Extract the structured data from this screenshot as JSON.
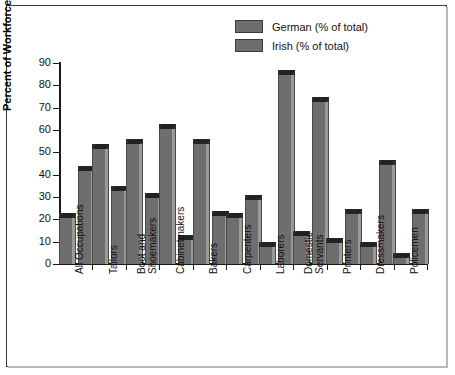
{
  "chart_data": {
    "type": "bar",
    "title": "",
    "xlabel": "",
    "ylabel": "Percent of Workforce",
    "ylim": [
      0,
      90
    ],
    "yticks": [
      0,
      10,
      20,
      30,
      40,
      50,
      60,
      70,
      80,
      90
    ],
    "grid": false,
    "legend_position": "top-right",
    "categories": [
      "All Occupations",
      "Tailors",
      "Boot and Shoemakers",
      "Cabinetmakers",
      "Bakers",
      "Carpenters",
      "Laborers",
      "Domestic Servants",
      "Printers",
      "Dressmakers",
      "Policemen"
    ],
    "category_lines": [
      [
        "All Occupations"
      ],
      [
        "Tailors"
      ],
      [
        "Boot and",
        "Shoemakers"
      ],
      [
        "Cabinetmakers"
      ],
      [
        "Bakers"
      ],
      [
        "Carpenters"
      ],
      [
        "Laborers"
      ],
      [
        "Domestic",
        "Servants"
      ],
      [
        "Printers"
      ],
      [
        "Dressmakers"
      ],
      [
        "Policemen"
      ]
    ],
    "series": [
      {
        "name": "German (% of total)",
        "color": "#6e6e6e",
        "values": [
          21,
          52,
          54,
          61,
          54,
          21,
          8,
          13,
          10,
          8,
          3
        ]
      },
      {
        "name": "Irish (% of total)",
        "color": "#6e6e6e",
        "values": [
          42,
          33,
          30,
          11,
          22,
          29,
          85,
          73,
          23,
          45,
          23
        ]
      }
    ]
  },
  "legend": {
    "items": [
      {
        "label": "German (% of total)",
        "swatch": "#6e6e6e"
      },
      {
        "label": "Irish (% of total)",
        "swatch": "#6e6e6e"
      }
    ]
  },
  "axis": {
    "y_title": "Percent of Workforce"
  }
}
